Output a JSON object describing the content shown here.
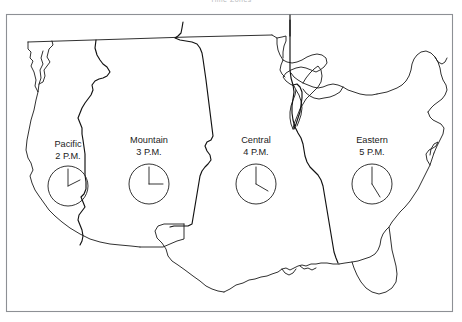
{
  "figure": {
    "caption": "Time Zones",
    "frame_color": "#8d9095",
    "line_color": "#1a1a1a"
  },
  "zones": [
    {
      "id": "pacific",
      "name": "Pacific",
      "time": "2 P.M.",
      "hour": 2,
      "minute": 0,
      "label_x": 68,
      "label_y": 147,
      "clock_cx": 68,
      "clock_cy": 186,
      "clock_r": 20
    },
    {
      "id": "mountain",
      "name": "Mountain",
      "time": "3 P.M.",
      "hour": 3,
      "minute": 0,
      "label_x": 149,
      "label_y": 143,
      "clock_cx": 149,
      "clock_cy": 184,
      "clock_r": 20
    },
    {
      "id": "central",
      "name": "Central",
      "time": "4 P.M.",
      "hour": 4,
      "minute": 0,
      "label_x": 256,
      "label_y": 143,
      "clock_cx": 256,
      "clock_cy": 184,
      "clock_r": 20
    },
    {
      "id": "eastern",
      "name": "Eastern",
      "time": "5 P.M.",
      "hour": 5,
      "minute": 0,
      "label_x": 372,
      "label_y": 143,
      "clock_cx": 372,
      "clock_cy": 184,
      "clock_r": 20
    }
  ]
}
